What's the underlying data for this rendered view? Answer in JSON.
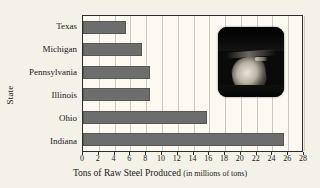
{
  "chart_data": {
    "type": "bar",
    "orientation": "horizontal",
    "title": "",
    "xlabel": "Tons of Raw Steel Produced (in millions of tons)",
    "xlabel_main": "Tons of Raw Steel Produced",
    "xlabel_paren": "(in millions of tons)",
    "ylabel": "State",
    "categories": [
      "Texas",
      "Michigan",
      "Pennsylvania",
      "Illinois",
      "Ohio",
      "Indiana"
    ],
    "values": [
      5.5,
      7.5,
      8.5,
      8.5,
      15.7,
      25.5
    ],
    "xlim": [
      0,
      28
    ],
    "xticks": [
      0,
      2,
      4,
      6,
      8,
      10,
      12,
      14,
      16,
      18,
      20,
      22,
      24,
      26,
      28
    ],
    "xtick_labels": [
      "0",
      "2",
      "4",
      "6",
      "8",
      "10",
      "12",
      "14",
      "16",
      "18",
      "20",
      "22",
      "24",
      "26",
      "28"
    ],
    "grid": "vertical",
    "legend": "none",
    "bar_color": "#6d6d6d",
    "plot_background": "#fbf9f2",
    "page_background": "#f4f1e8",
    "grid_color": "#ccc9bf",
    "axis_color": "#2c2c2c"
  },
  "inset": {
    "name": "steel-mill-photo",
    "description": "dark photograph inset overlay"
  }
}
